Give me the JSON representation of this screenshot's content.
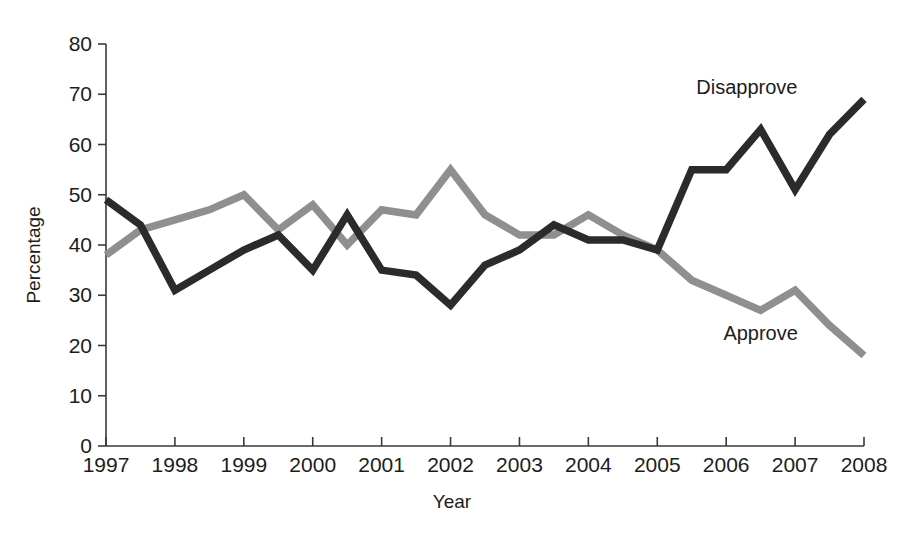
{
  "chart_data": {
    "type": "line",
    "title": "",
    "subtitle": "",
    "xlabel": "Year",
    "ylabel": "Percentage",
    "xlim": [
      1997,
      2008
    ],
    "ylim": [
      0,
      80
    ],
    "ytick_labels": [
      "0",
      "10",
      "20",
      "30",
      "40",
      "50",
      "60",
      "70",
      "80"
    ],
    "ytick_values": [
      0,
      10,
      20,
      30,
      40,
      50,
      60,
      70,
      80
    ],
    "xtick_labels": [
      "1997",
      "1998",
      "1999",
      "2000",
      "2001",
      "2002",
      "2003",
      "2004",
      "2005",
      "2006",
      "2007",
      "2008"
    ],
    "xtick_values": [
      1997,
      1998,
      1999,
      2000,
      2001,
      2002,
      2003,
      2004,
      2005,
      2006,
      2007,
      2008
    ],
    "grid": false,
    "legend_position": "inline-annotation",
    "x": [
      1997,
      1997.5,
      1998,
      1998.5,
      1999,
      1999.5,
      2000,
      2000.5,
      2001,
      2001.5,
      2002,
      2002.5,
      2003,
      2003.5,
      2004,
      2004.5,
      2005,
      2005.5,
      2006,
      2006.5,
      2007,
      2007.5,
      2008
    ],
    "series": [
      {
        "name": "Disapprove",
        "color": "#2b2b2b",
        "label_x": 2006.3,
        "label_y": 70,
        "values": [
          49,
          44,
          31,
          35,
          39,
          42,
          35,
          46,
          35,
          34,
          28,
          36,
          39,
          44,
          41,
          41,
          39,
          55,
          55,
          63,
          51,
          62,
          69
        ]
      },
      {
        "name": "Approve",
        "color": "#8f8f8f",
        "label_x": 2006.5,
        "label_y": 21,
        "values": [
          38,
          43,
          45,
          47,
          50,
          43,
          48,
          40,
          47,
          46,
          55,
          46,
          42,
          42,
          46,
          42,
          39,
          33,
          30,
          27,
          31,
          24,
          18
        ]
      }
    ]
  },
  "axes": {
    "y_axis_title": "Percentage",
    "x_axis_title": "Year"
  }
}
